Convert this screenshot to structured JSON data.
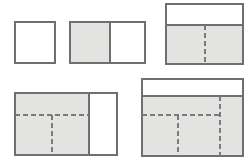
{
  "figure": {
    "width": 252,
    "height": 163,
    "background_color": "#ffffff",
    "stroke_color": "#6f6f6f",
    "fill_gray": "#e3e3e1",
    "fill_white": "#ffffff",
    "dash_color": "#7a7a7a",
    "stroke_width": 1.1,
    "dash_width": 1.6,
    "dash_pattern": "5,3"
  },
  "shapes": [
    {
      "id": "shape-1",
      "name": "unit-square",
      "x": 15,
      "y": 22,
      "w": 40,
      "h": 41,
      "regions": [
        {
          "name": "white-cell",
          "x": 15,
          "y": 22,
          "w": 40,
          "h": 41,
          "fill": "#ffffff"
        }
      ],
      "solid_lines": [],
      "dashed_lines": []
    },
    {
      "id": "shape-2",
      "name": "two-cell-rectangle",
      "x": 70,
      "y": 22,
      "w": 75,
      "h": 41,
      "regions": [
        {
          "name": "shaded-left-cell",
          "x": 70,
          "y": 22,
          "w": 40,
          "h": 41,
          "fill": "#e3e3e1"
        },
        {
          "name": "white-right-cell",
          "x": 110,
          "y": 22,
          "w": 35,
          "h": 41,
          "fill": "#ffffff"
        }
      ],
      "solid_lines": [
        {
          "name": "vertical-divider",
          "x1": 110,
          "y1": 22,
          "x2": 110,
          "y2": 63
        }
      ],
      "dashed_lines": []
    },
    {
      "id": "shape-3",
      "name": "banded-rectangle-with-center-partition",
      "x": 166,
      "y": 4,
      "w": 77,
      "h": 60,
      "regions": [
        {
          "name": "white-top-band",
          "x": 166,
          "y": 4,
          "w": 77,
          "h": 21,
          "fill": "#ffffff"
        },
        {
          "name": "shaded-lower-block",
          "x": 166,
          "y": 25,
          "w": 77,
          "h": 39,
          "fill": "#e3e3e1"
        }
      ],
      "solid_lines": [
        {
          "name": "band-separator",
          "x1": 166,
          "y1": 25,
          "x2": 243,
          "y2": 25
        }
      ],
      "dashed_lines": [
        {
          "name": "center-vertical-partition",
          "x1": 205,
          "y1": 25,
          "x2": 205,
          "y2": 64
        }
      ]
    },
    {
      "id": "shape-4",
      "name": "shaded-block-with-white-side-panel",
      "x": 15,
      "y": 93,
      "w": 102,
      "h": 62,
      "regions": [
        {
          "name": "shaded-main-block",
          "x": 15,
          "y": 93,
          "w": 74,
          "h": 62,
          "fill": "#e3e3e1"
        },
        {
          "name": "white-side-panel",
          "x": 89,
          "y": 93,
          "w": 28,
          "h": 62,
          "fill": "#ffffff"
        }
      ],
      "solid_lines": [
        {
          "name": "panel-divider",
          "x1": 89,
          "y1": 93,
          "x2": 89,
          "y2": 155
        }
      ],
      "dashed_lines": [
        {
          "name": "horizontal-partition",
          "x1": 15,
          "y1": 115,
          "x2": 89,
          "y2": 115
        },
        {
          "name": "vertical-partition",
          "x1": 52,
          "y1": 115,
          "x2": 52,
          "y2": 155
        }
      ]
    },
    {
      "id": "shape-5",
      "name": "banded-rectangle-with-three-partitions",
      "x": 142,
      "y": 79,
      "w": 101,
      "h": 77,
      "regions": [
        {
          "name": "white-top-band",
          "x": 142,
          "y": 79,
          "w": 101,
          "h": 17,
          "fill": "#ffffff"
        },
        {
          "name": "shaded-lower-block",
          "x": 142,
          "y": 96,
          "w": 101,
          "h": 60,
          "fill": "#e3e3e1"
        }
      ],
      "solid_lines": [
        {
          "name": "band-separator",
          "x1": 142,
          "y1": 96,
          "x2": 243,
          "y2": 96
        }
      ],
      "dashed_lines": [
        {
          "name": "right-vertical-partition",
          "x1": 220,
          "y1": 96,
          "x2": 220,
          "y2": 156
        },
        {
          "name": "horizontal-partition",
          "x1": 142,
          "y1": 115,
          "x2": 220,
          "y2": 115
        },
        {
          "name": "center-vertical-partition",
          "x1": 178,
          "y1": 115,
          "x2": 178,
          "y2": 156
        }
      ]
    }
  ]
}
